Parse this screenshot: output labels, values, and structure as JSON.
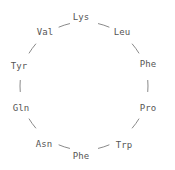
{
  "diagram": {
    "type": "cyclic-peptide",
    "background_color": "#ffffff",
    "label_color": "#555555",
    "bond_color": "#8a8a8a",
    "bond_width": 1,
    "ring_center": {
      "x": 84,
      "y": 86
    },
    "ring_radius": 64
  },
  "chart_data": {
    "type": "diagram",
    "layout": "circular",
    "direction": "clockwise",
    "residue_count": 10,
    "sequence": [
      "Lys",
      "Leu",
      "Phe",
      "Pro",
      "Trp",
      "Phe",
      "Asn",
      "Gln",
      "Tyr",
      "Val"
    ],
    "residues": [
      {
        "label": "Lys",
        "index": 1,
        "angle_deg": -90,
        "x": 81,
        "y": 17
      },
      {
        "label": "Leu",
        "index": 2,
        "angle_deg": -54,
        "x": 122,
        "y": 32
      },
      {
        "label": "Phe",
        "index": 3,
        "angle_deg": -18,
        "x": 148,
        "y": 64
      },
      {
        "label": "Pro",
        "index": 4,
        "angle_deg": 18,
        "x": 148,
        "y": 108
      },
      {
        "label": "Trp",
        "index": 5,
        "angle_deg": 54,
        "x": 124,
        "y": 145
      },
      {
        "label": "Phe",
        "index": 6,
        "angle_deg": 90,
        "x": 81,
        "y": 156
      },
      {
        "label": "Asn",
        "index": 7,
        "angle_deg": 126,
        "x": 44,
        "y": 144
      },
      {
        "label": "Gln",
        "index": 8,
        "angle_deg": 162,
        "x": 21,
        "y": 108
      },
      {
        "label": "Tyr",
        "index": 9,
        "angle_deg": 198,
        "x": 19,
        "y": 66
      },
      {
        "label": "Val",
        "index": 10,
        "angle_deg": 234,
        "x": 45,
        "y": 32
      }
    ],
    "bonds": [
      {
        "from": "Lys",
        "to": "Leu"
      },
      {
        "from": "Leu",
        "to": "Phe"
      },
      {
        "from": "Phe",
        "to": "Pro"
      },
      {
        "from": "Pro",
        "to": "Trp"
      },
      {
        "from": "Trp",
        "to": "Phe"
      },
      {
        "from": "Phe",
        "to": "Asn"
      },
      {
        "from": "Asn",
        "to": "Gln"
      },
      {
        "from": "Gln",
        "to": "Tyr"
      },
      {
        "from": "Tyr",
        "to": "Val"
      },
      {
        "from": "Val",
        "to": "Lys"
      }
    ],
    "xlabel": "",
    "ylabel": "",
    "legend": [],
    "grid": false
  }
}
